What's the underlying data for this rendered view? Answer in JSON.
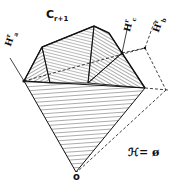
{
  "diagram": {
    "title": "C",
    "title_subscript": "r+1",
    "labels": {
      "h_a": "H",
      "h_a_sup": "r",
      "h_a_sub": "a",
      "h_c": "H",
      "h_c_sup": "r",
      "h_c_sub": "c",
      "h_b": "H",
      "h_b_sup": "r",
      "h_b_sub": "b",
      "origin": "o",
      "equation": "ℋ= ø"
    },
    "colors": {
      "ink": "#111111",
      "background": "#ffffff"
    }
  }
}
